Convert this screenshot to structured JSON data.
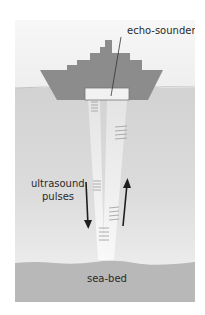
{
  "diagram": {
    "labels": {
      "echo_sounder": "echo-sounder",
      "ultrasound_line1": "ultrasound",
      "ultrasound_line2": "pulses",
      "sea_bed": "sea-bed"
    },
    "colors": {
      "sky": "#f3f3f3",
      "sea": "#d6d6d6",
      "ship": "#8c8c8c",
      "sea_bed": "#b4b4b4",
      "beam": "#f7f7f7",
      "arrow": "#1e1e1e",
      "transducer": "#f2f2f2"
    }
  }
}
